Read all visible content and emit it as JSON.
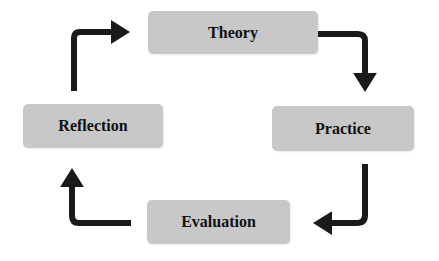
{
  "diagram": {
    "type": "cycle",
    "nodes": [
      {
        "id": "theory",
        "label": "Theory"
      },
      {
        "id": "practice",
        "label": "Practice"
      },
      {
        "id": "evaluation",
        "label": "Evaluation"
      },
      {
        "id": "reflection",
        "label": "Reflection"
      }
    ],
    "edges": [
      {
        "from": "theory",
        "to": "practice"
      },
      {
        "from": "practice",
        "to": "evaluation"
      },
      {
        "from": "evaluation",
        "to": "reflection"
      },
      {
        "from": "reflection",
        "to": "theory"
      }
    ],
    "colors": {
      "box_fill": "#c8c8c8",
      "text": "#111111",
      "arrow": "#1a1a1a"
    }
  }
}
